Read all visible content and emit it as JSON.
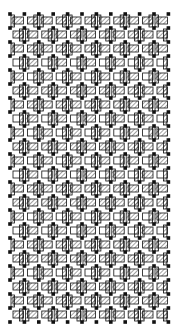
{
  "figure": {
    "colors": {
      "background": "#ffffff",
      "ink": "#111111",
      "hatch": "#333333"
    },
    "grid": {
      "left": 10,
      "top": 14,
      "cols": 11,
      "rows": 22,
      "pitch_x": 14.4,
      "pitch_y": 14.0
    },
    "row_styles": [
      "hatched",
      "hatched",
      "hatched",
      "white",
      "white",
      "hatched",
      "hatched",
      "white",
      "white",
      "hatched",
      "white",
      "white",
      "hatched",
      "hatched",
      "white",
      "white",
      "hatched",
      "hatched",
      "white",
      "hatched",
      "hatched",
      "hatched"
    ]
  }
}
